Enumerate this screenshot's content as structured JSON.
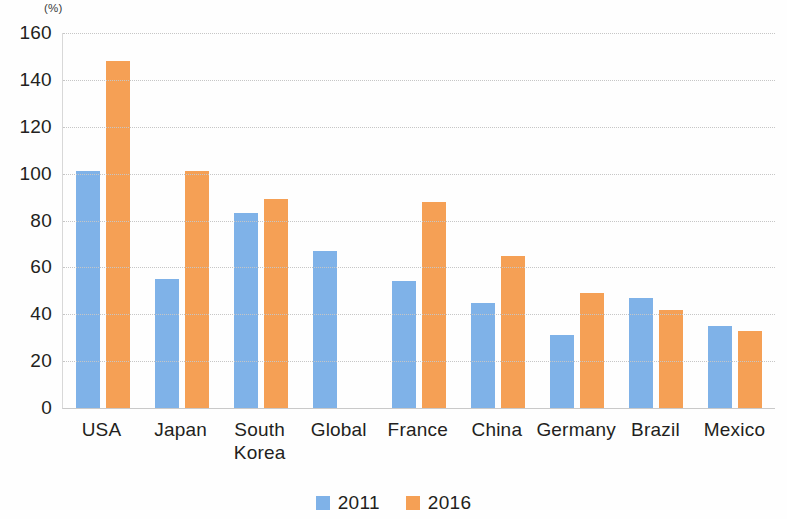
{
  "chart_data": {
    "type": "bar",
    "title": "",
    "subtitle": "",
    "xlabel": "",
    "ylabel": "",
    "unit_label": "(%)",
    "ylim": [
      0,
      160
    ],
    "ytick_step": 20,
    "yticks": [
      "160",
      "140",
      "120",
      "100",
      "80",
      "60",
      "40",
      "20",
      "0"
    ],
    "grid": true,
    "legend_position": "bottom-center",
    "categories": [
      "USA",
      "Japan",
      "South\nKorea",
      "Global",
      "France",
      "China",
      "Germany",
      "Brazil",
      "Mexico"
    ],
    "series": [
      {
        "name": "2011",
        "color": "#7FB2E8",
        "values": [
          101,
          55,
          83,
          67,
          54,
          45,
          31,
          47,
          35
        ]
      },
      {
        "name": "2016",
        "color": "#F5A055",
        "values": [
          148,
          101,
          89,
          null,
          88,
          65,
          49,
          42,
          33
        ]
      }
    ]
  },
  "legend": {
    "items": [
      {
        "label": "2011",
        "color": "#7FB2E8"
      },
      {
        "label": "2016",
        "color": "#F5A055"
      }
    ]
  },
  "colors": {
    "series_2011": "#7FB2E8",
    "series_2016": "#F5A055",
    "gridline": "#c6c6c6",
    "axis": "#c9c9c9",
    "text": "#231f20",
    "background": "#fefefe"
  }
}
